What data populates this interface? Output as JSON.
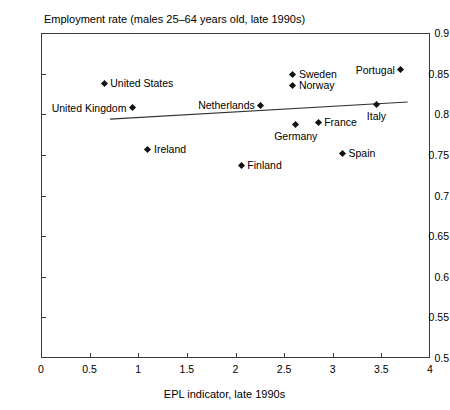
{
  "chart_data": {
    "type": "scatter",
    "title": "Employment rate (males 25–64 years old, late 1990s)",
    "xlabel": "EPL indicator, late 1990s",
    "ylabel": "",
    "xlim": [
      0,
      4
    ],
    "ylim": [
      0.5,
      0.9
    ],
    "xticks": [
      "0",
      "0.5",
      "1",
      "1.5",
      "2",
      "2.5",
      "3",
      "3.5",
      "4"
    ],
    "xtick_values": [
      0,
      0.5,
      1,
      1.5,
      2,
      2.5,
      3,
      3.5,
      4
    ],
    "yticks": [
      "0.5",
      "0.55",
      "0.6",
      "0.65",
      "0.7",
      "0.75",
      "0.8",
      "0.85",
      "0.9"
    ],
    "ytick_values": [
      0.5,
      0.55,
      0.6,
      0.65,
      0.7,
      0.75,
      0.8,
      0.85,
      0.9
    ],
    "grid": false,
    "legend": "none",
    "points": [
      {
        "label": "United States",
        "x": 0.65,
        "y": 0.838,
        "label_pos": "right"
      },
      {
        "label": "United Kingdom",
        "x": 0.94,
        "y": 0.808,
        "label_pos": "left"
      },
      {
        "label": "Ireland",
        "x": 1.1,
        "y": 0.757,
        "label_pos": "right"
      },
      {
        "label": "Finland",
        "x": 2.06,
        "y": 0.737,
        "label_pos": "right"
      },
      {
        "label": "Netherlands",
        "x": 2.26,
        "y": 0.811,
        "label_pos": "left"
      },
      {
        "label": "Sweden",
        "x": 2.59,
        "y": 0.849,
        "label_pos": "right"
      },
      {
        "label": "Norway",
        "x": 2.59,
        "y": 0.836,
        "label_pos": "right"
      },
      {
        "label": "Germany",
        "x": 2.62,
        "y": 0.787,
        "label_pos": "below"
      },
      {
        "label": "France",
        "x": 2.85,
        "y": 0.79,
        "label_pos": "right"
      },
      {
        "label": "Spain",
        "x": 3.1,
        "y": 0.752,
        "label_pos": "right"
      },
      {
        "label": "Italy",
        "x": 3.45,
        "y": 0.812,
        "label_pos": "below"
      },
      {
        "label": "Portugal",
        "x": 3.7,
        "y": 0.855,
        "label_pos": "left"
      }
    ],
    "trendline": {
      "x_start": 0.71,
      "y_start": 0.794,
      "x_end": 3.77,
      "y_end": 0.815
    },
    "colors": {
      "marker": "#111111",
      "axis": "#3a3a3a",
      "trendline": "#333333",
      "text": "#000000",
      "background": "#ffffff"
    }
  }
}
